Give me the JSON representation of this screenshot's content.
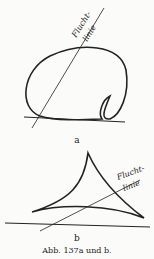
{
  "figure_a": {
    "label": "a",
    "annotation_line1": "Flucht-",
    "annotation_line2": "linie"
  },
  "figure_b": {
    "label": "b",
    "annotation_line1": "Flucht-",
    "annotation_line2": "linie"
  },
  "caption": "Abb. 137a und b."
}
